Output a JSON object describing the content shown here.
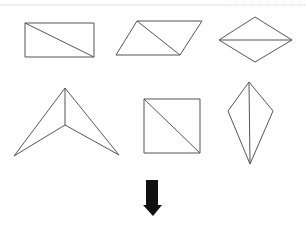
{
  "diagram": {
    "title": "",
    "colors": {
      "stroke": "#555555",
      "arrow": "#111111",
      "divider": "#dddddd",
      "background": "#ffffff"
    },
    "shapes": [
      {
        "name": "rectangle",
        "row": 1,
        "col": 1,
        "points": "25,23 94,23 94,57 25,57",
        "diagonal": "25,23 94,57"
      },
      {
        "name": "parallelogram",
        "row": 1,
        "col": 2,
        "points": "137,21 202,21 180,55 116,55",
        "diagonal": "137,21 180,55"
      },
      {
        "name": "rhombus",
        "row": 1,
        "col": 3,
        "points": "219,40 255,17 292,40 255,62",
        "diagonal": "219,40 292,40"
      },
      {
        "name": "dart",
        "row": 2,
        "col": 1,
        "points": "65,88 119,155 65,125 14,156",
        "diagonal": "65,88 65,125"
      },
      {
        "name": "square",
        "row": 2,
        "col": 2,
        "points": "144,99 200,99 200,153 144,153",
        "diagonal": "144,99 200,153"
      },
      {
        "name": "kite",
        "row": 2,
        "col": 3,
        "points": "249,82 273,111 250,164 228,111",
        "diagonal": "249,82 250,164"
      }
    ],
    "arrow": {
      "direction": "down",
      "points": "146,180 158,180 158,205 162,205 153,216 143,205 146,205"
    }
  }
}
